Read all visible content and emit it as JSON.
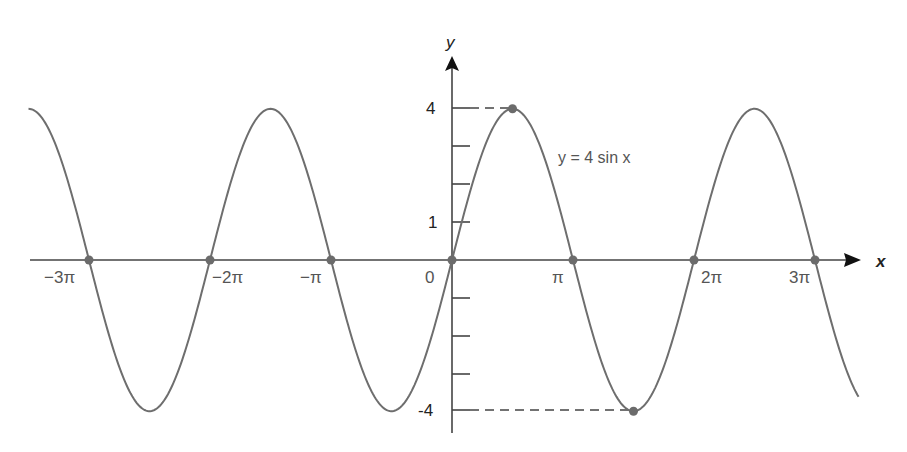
{
  "chart_data": {
    "type": "line",
    "title": "",
    "function": "y = 4 sin x",
    "xlabel": "x",
    "ylabel": "y",
    "xlim_pi": [
      -3.5,
      3.36
    ],
    "ylim": [
      -4.6,
      5.3
    ],
    "x_ticks": [
      {
        "value_pi": -3,
        "label": "−3π"
      },
      {
        "value_pi": -2,
        "label": "−2π"
      },
      {
        "value_pi": -1,
        "label": "−π"
      },
      {
        "value_pi": 0,
        "label": "0"
      },
      {
        "value_pi": 1,
        "label": "π"
      },
      {
        "value_pi": 2,
        "label": "2π"
      },
      {
        "value_pi": 3,
        "label": "3π"
      }
    ],
    "y_ticks": [
      {
        "value": 4,
        "label": "4"
      },
      {
        "value": 3,
        "label": ""
      },
      {
        "value": 2,
        "label": ""
      },
      {
        "value": 1,
        "label": "1"
      },
      {
        "value": -1,
        "label": ""
      },
      {
        "value": -2,
        "label": ""
      },
      {
        "value": -3,
        "label": ""
      },
      {
        "value": -4,
        "label": "-4"
      }
    ],
    "series": [
      {
        "name": "y = 4 sin x",
        "amplitude": 4,
        "color": "#6e6e6e"
      }
    ],
    "marked_points": [
      {
        "x_pi": -3,
        "y": 0
      },
      {
        "x_pi": -2,
        "y": 0
      },
      {
        "x_pi": -1,
        "y": 0
      },
      {
        "x_pi": 0,
        "y": 0
      },
      {
        "x_pi": 1,
        "y": 0
      },
      {
        "x_pi": 2,
        "y": 0
      },
      {
        "x_pi": 3,
        "y": 0
      },
      {
        "x_pi": 0.5,
        "y": 4
      },
      {
        "x_pi": 1.5,
        "y": -4
      }
    ],
    "annotations": [
      {
        "text": "y = 4 sin x",
        "position": "right of first positive peak"
      },
      {
        "text": "dashed line from y-axis at 4 to max point (π/2, 4)"
      },
      {
        "text": "dashed line from y-axis at -4 to min point (3π/2, -4)"
      }
    ],
    "grid": false,
    "legend": "none"
  },
  "labels": {
    "x_axis": "x",
    "y_axis": "y",
    "curve": "y = 4 sin x",
    "y_top": "4",
    "y_one": "1",
    "y_bottom": "-4",
    "x_m3": "−3π",
    "x_m2": "−2π",
    "x_m1": "−π",
    "x_0": "0",
    "x_1": "π",
    "x_2": "2π",
    "x_3": "3π"
  },
  "colors": {
    "curve": "#6e6e6e",
    "axis": "#333333",
    "point": "#6b6b6b"
  }
}
